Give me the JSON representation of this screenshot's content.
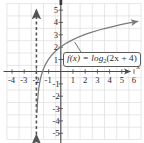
{
  "figure": {
    "caption": "",
    "callout": {
      "function_label": "f(x) = log",
      "base": "2",
      "argument": "(2x + 4)",
      "full_text": "f(x) = log2(2x + 4)"
    },
    "colors": {
      "grid": "#d9d9d9",
      "axis": "#4a4a4a",
      "curve": "#7a7a7a",
      "asymptote": "#555555",
      "label": "#2b2b2b",
      "background": "#ffffff"
    }
  },
  "chart_data": {
    "type": "line",
    "title": "",
    "xlabel": "x",
    "ylabel": "",
    "xlim": [
      -4.6,
      6.6
    ],
    "ylim": [
      -5.6,
      5.6
    ],
    "grid": true,
    "legend": null,
    "x_ticks": [
      -4,
      -3,
      -2,
      -1,
      1,
      2,
      3,
      4,
      5,
      6
    ],
    "x_tick_labels": [
      "-4",
      "-3",
      "-2",
      "-1",
      "1",
      "2",
      "3",
      "4",
      "5",
      "6"
    ],
    "y_ticks": [
      -5,
      -4,
      -3,
      -2,
      -1,
      1,
      2,
      3,
      4,
      5
    ],
    "y_tick_labels": [
      "-5",
      "-4",
      "-3",
      "-2",
      "-1",
      "1",
      "2",
      "3",
      "4",
      "5"
    ],
    "series": [
      {
        "name": "f(x) = log2(2x + 4)",
        "expression": "log2(2x + 4)",
        "style": "solid",
        "arrow_end": "right",
        "points": [
          [
            -1.95,
            -3.32
          ],
          [
            -1.92,
            -2.64
          ],
          [
            -1.9,
            -2.32
          ],
          [
            -1.85,
            -1.74
          ],
          [
            -1.8,
            -1.32
          ],
          [
            -1.7,
            -0.74
          ],
          [
            -1.6,
            -0.32
          ],
          [
            -1.5,
            0.0
          ],
          [
            -1.4,
            0.26
          ],
          [
            -1.25,
            0.58
          ],
          [
            -1.0,
            1.0
          ],
          [
            -0.75,
            1.32
          ],
          [
            -0.5,
            1.58
          ],
          [
            -0.25,
            1.81
          ],
          [
            0,
            2.0
          ],
          [
            0.5,
            2.32
          ],
          [
            1,
            2.58
          ],
          [
            1.5,
            2.81
          ],
          [
            2,
            3.0
          ],
          [
            2.5,
            3.17
          ],
          [
            3,
            3.32
          ],
          [
            3.5,
            3.46
          ],
          [
            4,
            3.58
          ],
          [
            4.5,
            3.7
          ],
          [
            5,
            3.81
          ],
          [
            5.5,
            3.91
          ],
          [
            6,
            4.0
          ],
          [
            6.3,
            4.05
          ]
        ]
      }
    ],
    "annotations": [
      {
        "type": "asymptote",
        "name": "vertical-asymptote",
        "orientation": "vertical",
        "value": -2,
        "style": "dashed",
        "arrows": "both"
      },
      {
        "type": "callout",
        "name": "function-label",
        "text": "f(x) = log2(2x + 4)",
        "anchor_point": [
          1.25,
          2.62
        ]
      }
    ]
  }
}
